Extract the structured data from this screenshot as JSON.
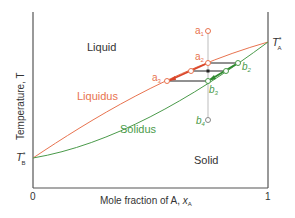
{
  "diagram": {
    "type": "phase-diagram",
    "regions": {
      "liquid": "Liquid",
      "solid": "Solid"
    },
    "curves": {
      "liquidus": "Liquidus",
      "solidus": "Solidus"
    },
    "axes": {
      "y_label": "Temperature, T",
      "x_label_prefix": "Mole fraction of A, ",
      "x_label_var": "x",
      "x_label_sub": "A",
      "x_min": "0",
      "x_max": "1"
    },
    "melting_points": {
      "A": {
        "symbol": "T",
        "sup": "*",
        "sub": "A"
      },
      "B": {
        "symbol": "T",
        "sup": "*",
        "sub": "B"
      }
    },
    "points": {
      "a1": {
        "letter": "a",
        "sub": "1"
      },
      "a2": {
        "letter": "a",
        "sub": "2"
      },
      "a3": {
        "letter": "a",
        "sub": "3"
      },
      "b2": {
        "letter": "b",
        "sub": "2"
      },
      "b3": {
        "letter": "b",
        "sub": "3"
      },
      "b4": {
        "letter": "b",
        "sub": "4"
      }
    },
    "colors": {
      "liquidus": "#e8734f",
      "solidus": "#4a9a4a",
      "axis": "#555555",
      "tie_line": "#222222",
      "isopleth": "#c8c8c8",
      "text": "#333333"
    }
  }
}
